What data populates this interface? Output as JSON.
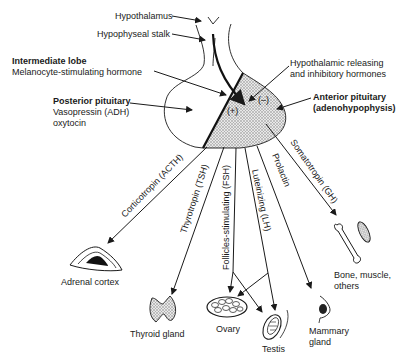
{
  "labels": {
    "hypothalamus": "Hypothalamus",
    "stalk": "Hypophyseal stalk",
    "intermediate_title": "Intermediate lobe",
    "intermediate_sub": "Melanocyte-stimulating hormone",
    "posterior_title": "Posterior pituitary",
    "posterior_sub1": "Vasopressin (ADH)",
    "posterior_sub2": "oxytocin",
    "releasing1": "Hypothalamic releasing",
    "releasing2": "and inhibitory hormones",
    "anterior_title": "Anterior pituitary",
    "anterior_sub": "(adenohypophysis)",
    "plus": "(+)",
    "minus": "(–)"
  },
  "hormones": {
    "acth": "Corticotropin (ACTH)",
    "tsh": "Thyrotropin (TSH)",
    "fsh": "Follicles-stimulating (FSH)",
    "lh": "Luteinizing (LH)",
    "prolactin": "Prolactin",
    "gh": "Somatotropin (GH)"
  },
  "targets": {
    "adrenal": "Adrenal cortex",
    "thyroid": "Thyroid gland",
    "ovary": "Ovary",
    "testis": "Testis",
    "mammary1": "Mammary",
    "mammary2": "gland",
    "bone1": "Bone, muscle,",
    "bone2": "others"
  }
}
